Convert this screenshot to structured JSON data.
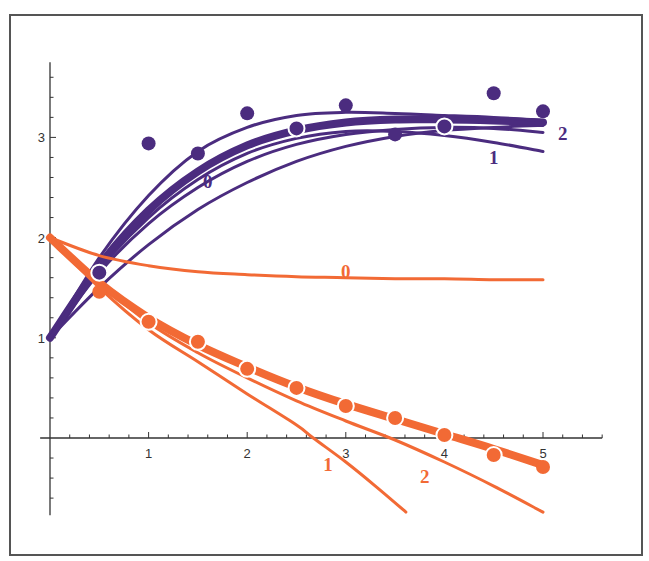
{
  "chart_data": {
    "type": "line",
    "title": "",
    "xlabel": "",
    "ylabel": "",
    "xlim": [
      -0.1,
      5.6
    ],
    "ylim": [
      -0.77,
      3.75
    ],
    "x_ticks": [
      1,
      2,
      3,
      4,
      5
    ],
    "x_tick_labels": [
      "1",
      "2",
      "3",
      "4",
      "5"
    ],
    "y_ticks": [
      1,
      2,
      3
    ],
    "y_tick_labels": [
      "1",
      "2",
      "3"
    ],
    "minor_tick_step": 0.2,
    "grid": false,
    "colors": {
      "purple": "#4b2c7f",
      "orange": "#f26a35",
      "axis": "#333333",
      "frame": "#555555"
    },
    "series": [
      {
        "name": "purple-data",
        "kind": "points",
        "color": "purple",
        "x": [
          0.5,
          1.0,
          1.5,
          2.0,
          2.5,
          3.0,
          3.5,
          4.0,
          4.5,
          5.0
        ],
        "y": [
          1.65,
          2.94,
          2.84,
          3.24,
          3.09,
          3.32,
          3.03,
          3.11,
          3.44,
          3.26
        ],
        "outlined": [
          true,
          false,
          false,
          false,
          true,
          false,
          false,
          true,
          false,
          false
        ]
      },
      {
        "name": "purple-fit-thick",
        "kind": "curve",
        "color": "purple",
        "weight": "thick",
        "x": [
          0,
          0.5,
          1,
          1.5,
          2,
          2.5,
          3,
          3.5,
          4,
          4.5,
          5
        ],
        "y": [
          1.0,
          1.72,
          2.27,
          2.66,
          2.92,
          3.07,
          3.15,
          3.18,
          3.18,
          3.17,
          3.15
        ]
      },
      {
        "name": "purple-fit-upper",
        "kind": "curve",
        "color": "purple",
        "weight": "thin",
        "x": [
          0,
          0.5,
          1,
          1.5,
          2,
          2.5,
          3,
          3.5,
          4,
          4.5,
          5
        ],
        "y": [
          1.0,
          1.8,
          2.42,
          2.86,
          3.1,
          3.22,
          3.25,
          3.24,
          3.22,
          3.2,
          3.17
        ]
      },
      {
        "name": "purple-fit-2",
        "label": "2",
        "kind": "curve",
        "color": "purple",
        "weight": "thin",
        "x": [
          0,
          0.5,
          1,
          1.5,
          2,
          2.5,
          3,
          3.5,
          4,
          4.5,
          5
        ],
        "y": [
          1.0,
          1.65,
          2.14,
          2.5,
          2.76,
          2.93,
          3.03,
          3.08,
          3.1,
          3.09,
          3.05
        ]
      },
      {
        "name": "purple-fit-0",
        "label": "0",
        "kind": "curve",
        "color": "purple",
        "weight": "thin",
        "x": [
          0,
          0.5,
          1,
          1.5,
          2,
          2.5,
          3,
          3.5,
          4,
          4.5,
          5
        ],
        "y": [
          1.0,
          1.5,
          1.93,
          2.28,
          2.55,
          2.76,
          2.91,
          3.01,
          3.07,
          3.1,
          3.12
        ]
      },
      {
        "name": "purple-fit-1",
        "label": "1",
        "kind": "curve",
        "color": "purple",
        "weight": "thin",
        "x": [
          0,
          0.5,
          1,
          1.5,
          2,
          2.5,
          3,
          3.5,
          4,
          4.5,
          5
        ],
        "y": [
          1.0,
          1.68,
          2.2,
          2.58,
          2.84,
          2.99,
          3.06,
          3.06,
          3.02,
          2.95,
          2.86
        ]
      },
      {
        "name": "orange-data",
        "kind": "points",
        "color": "orange",
        "x": [
          0.5,
          1.0,
          1.5,
          2.0,
          2.5,
          3.0,
          3.5,
          4.0,
          4.5,
          5.0
        ],
        "y": [
          1.46,
          1.16,
          0.96,
          0.69,
          0.5,
          0.32,
          0.2,
          0.03,
          -0.17,
          -0.29
        ],
        "outlined": [
          false,
          true,
          true,
          true,
          true,
          true,
          true,
          true,
          true,
          false
        ]
      },
      {
        "name": "orange-fit-thick",
        "kind": "curve",
        "color": "orange",
        "weight": "thick",
        "x": [
          0,
          0.5,
          1,
          1.5,
          2,
          2.5,
          3,
          3.5,
          4,
          4.5,
          5
        ],
        "y": [
          2.0,
          1.55,
          1.2,
          0.93,
          0.71,
          0.51,
          0.34,
          0.19,
          0.04,
          -0.11,
          -0.27
        ]
      },
      {
        "name": "orange-fit-0",
        "label": "0",
        "kind": "curve",
        "color": "orange",
        "weight": "thin",
        "x": [
          0,
          0.5,
          1,
          1.5,
          2,
          2.5,
          3,
          3.5,
          4,
          4.5,
          5
        ],
        "y": [
          2.0,
          1.82,
          1.72,
          1.66,
          1.63,
          1.61,
          1.6,
          1.59,
          1.59,
          1.58,
          1.58
        ]
      },
      {
        "name": "orange-fit-2",
        "label": "2",
        "kind": "curve",
        "color": "orange",
        "weight": "thin",
        "x": [
          0,
          0.5,
          1,
          1.5,
          2,
          2.5,
          3,
          3.5,
          4,
          4.5,
          5
        ],
        "y": [
          2.0,
          1.55,
          1.15,
          0.85,
          0.6,
          0.37,
          0.17,
          -0.02,
          -0.24,
          -0.48,
          -0.74
        ]
      },
      {
        "name": "orange-fit-1",
        "label": "1",
        "kind": "curve",
        "color": "orange",
        "weight": "thin",
        "x": [
          0,
          0.5,
          1,
          1.5,
          2,
          2.5,
          2.67,
          3,
          3.3,
          3.61
        ],
        "y": [
          2.0,
          1.5,
          1.08,
          0.76,
          0.44,
          0.13,
          0.0,
          -0.24,
          -0.48,
          -0.74
        ]
      }
    ],
    "annotations": [
      {
        "text": "0",
        "color": "purple",
        "x": 1.6,
        "y": 2.5
      },
      {
        "text": "1",
        "color": "purple",
        "x": 4.5,
        "y": 2.73
      },
      {
        "text": "2",
        "color": "purple",
        "x": 5.2,
        "y": 2.97
      },
      {
        "text": "0",
        "color": "orange",
        "x": 3.0,
        "y": 1.6
      },
      {
        "text": "1",
        "color": "orange",
        "x": 2.82,
        "y": -0.33
      },
      {
        "text": "2",
        "color": "orange",
        "x": 3.8,
        "y": -0.45
      }
    ]
  }
}
